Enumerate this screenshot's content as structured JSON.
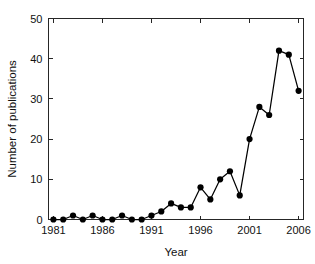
{
  "chart_data": {
    "type": "line",
    "title": "",
    "xlabel": "Year",
    "ylabel": "Number of publications",
    "xlim": [
      1980.5,
      2006.5
    ],
    "ylim": [
      0,
      50
    ],
    "xticks": [
      1981,
      1986,
      1991,
      1996,
      2001,
      2006
    ],
    "xtick_labels": [
      "1981",
      "1986",
      "1991",
      "1996",
      "2001",
      "2006"
    ],
    "yticks": [
      0,
      10,
      20,
      30,
      40,
      50
    ],
    "ytick_labels": [
      "0",
      "10",
      "20",
      "30",
      "40",
      "50"
    ],
    "grid": false,
    "legend": false,
    "marker": "filled-circle",
    "line_color": "#000000",
    "marker_color": "#000000",
    "x": [
      1981,
      1982,
      1983,
      1984,
      1985,
      1986,
      1987,
      1988,
      1989,
      1990,
      1991,
      1992,
      1993,
      1994,
      1995,
      1996,
      1997,
      1998,
      1999,
      2000,
      2001,
      2002,
      2003,
      2004,
      2005,
      2006
    ],
    "values": [
      0,
      0,
      1,
      0,
      1,
      0,
      0,
      1,
      0,
      0,
      1,
      2,
      4,
      3,
      3,
      8,
      5,
      10,
      12,
      6,
      20,
      28,
      26,
      42,
      41,
      32
    ]
  },
  "axis_titles": {
    "x": "Year",
    "y": "Number of publications"
  }
}
